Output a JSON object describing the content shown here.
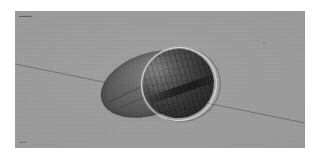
{
  "scene": {
    "title": "3D shaded rendering of a cut ellipsoid solid",
    "canvas_background": "#9a9a9a",
    "page_background": "#ffffff",
    "canvas": {
      "x": 15,
      "y": 11,
      "width": 290,
      "height": 137
    }
  },
  "annotations": {
    "top_left_label": "▬▬▬",
    "bottom_left_label": "▬▬"
  },
  "objects": {
    "solid_body": {
      "name": "ellipsoid-body",
      "fill_light": "#7e7e7e",
      "fill_dark": "#3b3b3b"
    },
    "cut_plane": {
      "name": "circular-cut-plane",
      "rim_color": "#dcdcd4",
      "interior_light": "#6e6e6e",
      "interior_dark": "#1d1d1d"
    },
    "axis_line": {
      "name": "diagonal-construction-line",
      "color": "#3c3c3c",
      "angle_deg": 11.5
    }
  }
}
